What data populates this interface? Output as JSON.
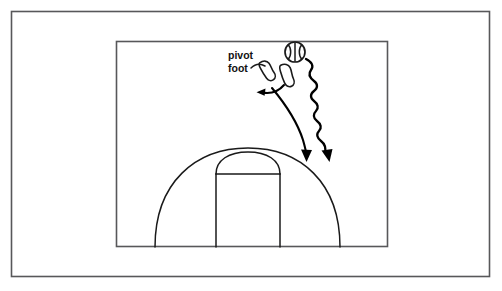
{
  "figure": {
    "background_color": "#ffffff",
    "outer_frame": {
      "name": "outer-border",
      "x": 11,
      "y": 11,
      "width": 479,
      "height": 266,
      "stroke_color": "#58585a"
    },
    "inner_frame": {
      "name": "court-frame",
      "x": 116,
      "y": 41,
      "width": 272,
      "height": 206,
      "stroke_color": "#58585a"
    }
  },
  "annotations": {
    "pivot_label": {
      "line1": "pivot",
      "line2": "foot",
      "x": 228,
      "y1": 55,
      "y2": 68,
      "color": "#111111"
    }
  },
  "court": {
    "stroke_color": "#1a1a1a",
    "baseline_y": 247,
    "three_point_arc": {
      "left_x": 155,
      "right_x": 340,
      "apex_x": 248,
      "apex_y": 148
    },
    "key": {
      "left_x": 216,
      "right_x": 280,
      "top_y": 174,
      "bottom_y": 247
    },
    "free_throw_circle": {
      "center_x": 248,
      "top_y": 152
    }
  },
  "objects": {
    "ball": {
      "name": "basketball",
      "center_x": 295,
      "center_y": 52,
      "radius": 10,
      "fill": "#ffffff",
      "stroke": "#1a1a1a"
    },
    "pivot_foot": {
      "name": "pivot-foot-shape",
      "center_x": 269,
      "center_y": 69,
      "rotation_deg": -35
    },
    "other_foot": {
      "name": "other-foot-shape",
      "center_x": 288,
      "center_y": 74,
      "rotation_deg": -25
    }
  },
  "arrows": {
    "step_arrow": {
      "name": "step-direction-arrow",
      "description": "short curved arrow pointing left",
      "tip_x": 257,
      "tip_y": 92,
      "color": "#000000"
    },
    "pass_arrow": {
      "name": "pass-path-arrow",
      "description": "long smooth curved arrow pointing down",
      "tip_x": 306,
      "tip_y": 161,
      "color": "#000000"
    },
    "dribble_arrow": {
      "name": "dribble-path-arrow",
      "description": "wavy line arrow pointing down",
      "tip_x": 329,
      "tip_y": 162,
      "color": "#000000"
    }
  }
}
